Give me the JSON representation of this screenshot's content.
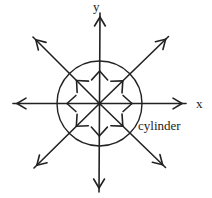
{
  "diagram": {
    "labels": {
      "y_axis": "y",
      "x_axis": "x",
      "cylinder": "cylinder"
    },
    "colors": {
      "background": "#ffffff",
      "stroke": "#222222",
      "text": "#222222"
    },
    "center": {
      "x": 99.5,
      "y": 103.5
    },
    "circle_radius": 42.5,
    "center_dot_radius": 2.1,
    "inner_arrowhead_radius": 32.5,
    "outer_arrows": [
      {
        "dir": "up",
        "tip": [
          100.0,
          13.0
        ]
      },
      {
        "dir": "up-right",
        "tip": [
          168.5,
          36.5
        ]
      },
      {
        "dir": "right",
        "tip": [
          186.0,
          103.5
        ]
      },
      {
        "dir": "down-right",
        "tip": [
          165.5,
          167.5
        ]
      },
      {
        "dir": "down",
        "tip": [
          99.0,
          192.0
        ]
      },
      {
        "dir": "down-left",
        "tip": [
          34.0,
          168.0
        ]
      },
      {
        "dir": "left",
        "tip": [
          13.0,
          103.5
        ]
      },
      {
        "dir": "up-left",
        "tip": [
          33.0,
          37.0
        ]
      }
    ],
    "style": {
      "stroke_width": 1.6,
      "circle_stroke_width": 1.4,
      "outer_head_len": 10.5,
      "outer_head_half_angle_deg": 31,
      "outer_head_back_offset": 4,
      "inner_head_len": 12,
      "inner_head_half_angle_deg": 42
    }
  }
}
